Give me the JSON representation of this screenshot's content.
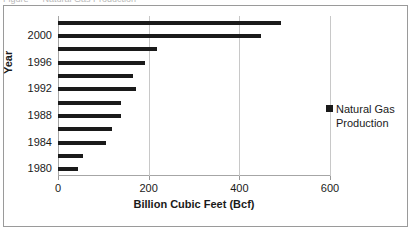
{
  "top_clipped_text": "Figure  — Natural Gas Production",
  "chart_data": {
    "type": "bar",
    "orientation": "horizontal",
    "title": "",
    "xlabel": "Billion Cubic Feet (Bcf)",
    "ylabel": "Year",
    "xlim": [
      0,
      600
    ],
    "xticks": [
      0,
      200,
      400,
      600
    ],
    "xtick_labels": [
      "0",
      "200",
      "400",
      "600"
    ],
    "ytick_labels": [
      "2000",
      "1996",
      "1992",
      "1988",
      "1984",
      "1980"
    ],
    "grid": "vertical",
    "legend_position": "right",
    "legend": [
      "Natural Gas Production"
    ],
    "series": [
      {
        "name": "Natural Gas Production",
        "color": "#1a1a1a",
        "categories": [
          "2002",
          "2000",
          "1998",
          "1996",
          "1994",
          "1992",
          "1990",
          "1988",
          "1986",
          "1984",
          "1982",
          "1980"
        ],
        "values": [
          493,
          448,
          219,
          192,
          165,
          172,
          140,
          140,
          120,
          105,
          55,
          45
        ]
      }
    ]
  },
  "axis": {
    "x_title": "Billion Cubic Feet (Bcf)",
    "y_title": "Year"
  },
  "legend": {
    "label": "Natural Gas Production",
    "swatch_icon": "square-marker-icon",
    "swatch_color": "#1a1a1a"
  }
}
